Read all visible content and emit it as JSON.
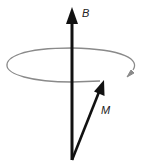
{
  "diagram": {
    "type": "physics-vector-diagram",
    "vectors": [
      {
        "name": "B",
        "label": "B",
        "from": [
          72,
          160
        ],
        "to": [
          72,
          8
        ],
        "color": "#111111"
      },
      {
        "name": "M",
        "label": "M",
        "from": [
          72,
          160
        ],
        "to": [
          103,
          81
        ],
        "color": "#111111"
      }
    ],
    "precession_path": {
      "shape": "ellipse",
      "center": [
        72,
        65
      ],
      "rx": 65,
      "ry": 17,
      "color": "#8a8a8a",
      "direction_arrow": "clockwise-as-viewed-from-above"
    }
  },
  "labels": {
    "b_label": "B",
    "m_label": "M"
  },
  "colors": {
    "vector": "#111111",
    "orbit": "#8a8a8a",
    "background": "#ffffff"
  }
}
